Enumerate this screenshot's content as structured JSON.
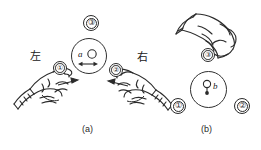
{
  "figure": {
    "background_color": "#ffffff",
    "ink_color": "#2b2b2b",
    "width": 261,
    "height": 150
  },
  "panel_a": {
    "caption": "(a)",
    "left_label": "左",
    "right_label": "右",
    "center_disc": {
      "item_label": "a",
      "knob_name": "small-circle-knob",
      "arrow": "double-headed-horizontal-arrow"
    },
    "tokens": [
      {
        "id": "token-3-top",
        "numeral": "③",
        "digit": "3"
      },
      {
        "id": "token-1-left-hand",
        "numeral": "①",
        "digit": "1"
      },
      {
        "id": "token-2-right-hand",
        "numeral": "②",
        "digit": "2"
      }
    ],
    "hands": [
      {
        "id": "left-hand",
        "side": "left"
      },
      {
        "id": "right-hand",
        "side": "right"
      }
    ]
  },
  "panel_b": {
    "caption": "(b)",
    "center_disc": {
      "item_label": "b",
      "knob_name": "pin-with-dot"
    },
    "tokens": [
      {
        "id": "token-3-in-hand",
        "numeral": "③",
        "digit": "3"
      },
      {
        "id": "token-1-bottom-left",
        "numeral": "①",
        "digit": "1"
      },
      {
        "id": "token-2-bottom-right",
        "numeral": "②",
        "digit": "2"
      }
    ],
    "hands": [
      {
        "id": "upper-hand",
        "side": "right"
      }
    ]
  }
}
